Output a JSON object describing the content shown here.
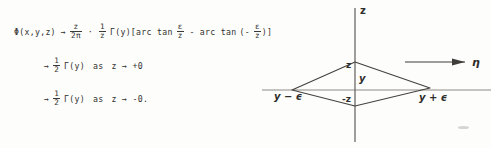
{
  "document": {
    "kind": "handwritten-math-figure-page"
  },
  "equations": {
    "line1": {
      "lhs": "Φ(x,y,z)",
      "arrow": "→",
      "frac1_num": "z",
      "frac1_den": "2π",
      "dot": "·",
      "frac2_num": "1",
      "frac2_den": "z",
      "gamma": "Γ(y)",
      "bracket_open": "[",
      "arctan1": "arc tan",
      "frac3_num": "ε",
      "frac3_den": "z",
      "minus": "-",
      "arctan2": "arc tan",
      "paren_open": "(-",
      "frac4_num": "ε",
      "frac4_den": "z",
      "paren_close": ")",
      "bracket_close": "]"
    },
    "line2": {
      "arrow": "→",
      "frac_num": "1",
      "frac_den": "2",
      "gamma": "Γ(y)",
      "as": "as",
      "limit": "z → +0"
    },
    "line3": {
      "arrow": "→",
      "frac_num": "1",
      "frac_den": "2",
      "gamma": "Γ(y)",
      "as": "as",
      "limit": "z → -0."
    }
  },
  "figure": {
    "axis_vertical_label": "z",
    "axis_horizontal_label": "η",
    "interior_upper_label": "z",
    "interior_center_label": "y",
    "interior_lower_label": "-z",
    "vertex_left_label": "y − ϵ",
    "vertex_right_label": "y + ϵ",
    "colors": {
      "ink": "#32312f",
      "line": "#45433f",
      "paper": "#fdfdfb"
    }
  }
}
